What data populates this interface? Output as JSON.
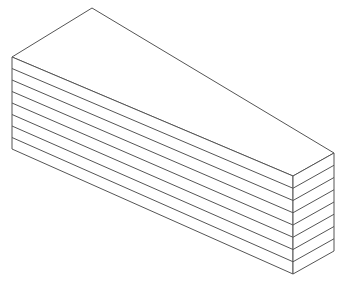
{
  "diagram": {
    "type": "isometric-layered-block",
    "layer_count": 8,
    "colors": {
      "background": "#ffffff",
      "stroke": "#555555",
      "top_face": "#ffffff",
      "left_face": "#ffffff",
      "right_face": "#ffffff"
    },
    "vertices": {
      "apex_back": [
        92,
        8
      ],
      "left_top": [
        12,
        57
      ],
      "left_bottom": [
        12,
        149
      ],
      "front_top": [
        293,
        176
      ],
      "front_bottom": [
        293,
        274
      ],
      "right_top": [
        334,
        153
      ],
      "right_bottom": [
        334,
        251
      ]
    }
  }
}
